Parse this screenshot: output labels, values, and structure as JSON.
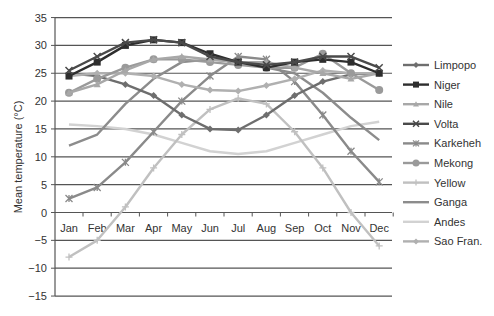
{
  "chart_data": {
    "type": "line",
    "title": "",
    "xlabel": "",
    "ylabel": "Mean temperature (°C)",
    "ylim": [
      -15,
      35
    ],
    "yticks": [
      35,
      30,
      25,
      20,
      15,
      10,
      5,
      0,
      -5,
      -10,
      -15
    ],
    "grid": true,
    "legend_position": "right",
    "categories": [
      "Jan",
      "Feb",
      "Mar",
      "Apr",
      "May",
      "Jun",
      "Jul",
      "Aug",
      "Sep",
      "Oct",
      "Nov",
      "Dec"
    ],
    "series": [
      {
        "name": "Limpopo",
        "color": "#6e6e6e",
        "marker": "diamond",
        "values": [
          25,
          24.5,
          23,
          21,
          17.5,
          15,
          14.8,
          17.5,
          21,
          23.5,
          24.8,
          25
        ]
      },
      {
        "name": "Niger",
        "color": "#2e2e2e",
        "marker": "square",
        "values": [
          24.5,
          27,
          30,
          31,
          30.5,
          28.5,
          27,
          26,
          27,
          27.5,
          27,
          25
        ]
      },
      {
        "name": "Nile",
        "color": "#a8a8a8",
        "marker": "triangle",
        "values": [
          21.5,
          23,
          25.5,
          27.5,
          28,
          27.5,
          27,
          27,
          26,
          25,
          24,
          25
        ]
      },
      {
        "name": "Volta",
        "color": "#4a4a4a",
        "marker": "x",
        "values": [
          25.5,
          28,
          30.5,
          31,
          30.5,
          28,
          27,
          26.5,
          27,
          28,
          28,
          26
        ]
      },
      {
        "name": "Karkeheh",
        "color": "#8a8a8a",
        "marker": "star",
        "values": [
          2.5,
          4.5,
          9,
          14.5,
          20,
          24.5,
          28,
          27.5,
          23.5,
          17.5,
          11,
          5.5
        ]
      },
      {
        "name": "Mekong",
        "color": "#9a9a9a",
        "marker": "circle",
        "values": [
          21.5,
          24,
          26,
          27.5,
          27.5,
          27,
          26.5,
          26,
          26,
          28.5,
          25,
          22
        ]
      },
      {
        "name": "Yellow",
        "color": "#c0c0c0",
        "marker": "plus",
        "values": [
          -8,
          -5,
          1,
          8,
          14,
          18.5,
          20.5,
          19.5,
          14.5,
          8,
          0,
          -6
        ]
      },
      {
        "name": "Ganga",
        "color": "#8c8c8c",
        "marker": "none",
        "values": [
          12,
          14,
          19.5,
          24,
          27,
          27.5,
          27,
          26,
          25,
          21.5,
          17,
          13
        ]
      },
      {
        "name": "Andes",
        "color": "#d2d2d2",
        "marker": "none",
        "values": [
          15.8,
          15.5,
          15,
          14,
          12.5,
          11,
          10.5,
          11,
          12.5,
          14,
          15.5,
          16.3
        ]
      },
      {
        "name": "Sao Fran.",
        "color": "#b0b0b0",
        "marker": "diamond",
        "values": [
          24.5,
          25,
          25,
          24.5,
          23,
          22,
          21.8,
          22.8,
          24,
          25.5,
          25,
          25
        ]
      }
    ]
  }
}
